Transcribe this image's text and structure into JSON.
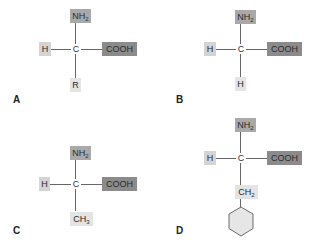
{
  "figure": {
    "panels": [
      {
        "id": "A",
        "label": "A",
        "top_group": {
          "main": "NH",
          "sub": "2"
        },
        "left_group": "H",
        "center_atom": "C",
        "right_group": "COOH",
        "bottom_group": {
          "main": "R",
          "sub": ""
        }
      },
      {
        "id": "B",
        "label": "B",
        "top_group": {
          "main": "NH",
          "sub": "2"
        },
        "left_group": "H",
        "center_atom": "C",
        "right_group": "COOH",
        "bottom_group": {
          "main": "H",
          "sub": ""
        }
      },
      {
        "id": "C",
        "label": "C",
        "top_group": {
          "main": "NH",
          "sub": "2"
        },
        "left_group": "H",
        "center_atom": "C",
        "right_group": "COOH",
        "bottom_group": {
          "main": "CH",
          "sub": "3"
        }
      },
      {
        "id": "D",
        "label": "D",
        "top_group": {
          "main": "NH",
          "sub": "2"
        },
        "left_group": "H",
        "center_atom": "C",
        "right_group": "COOH",
        "bottom_group": {
          "main": "CH",
          "sub": "2"
        },
        "ring": "cyclohexane-ring"
      }
    ],
    "colors": {
      "nh2_fill": "#a9a9a9",
      "cooh_fill": "#8b8b8b",
      "h_fill": "#d4d4d4",
      "side_chain_fill": "#e4e4e4",
      "bond": "#666666",
      "ring_fill": "#e6e6e6"
    }
  }
}
